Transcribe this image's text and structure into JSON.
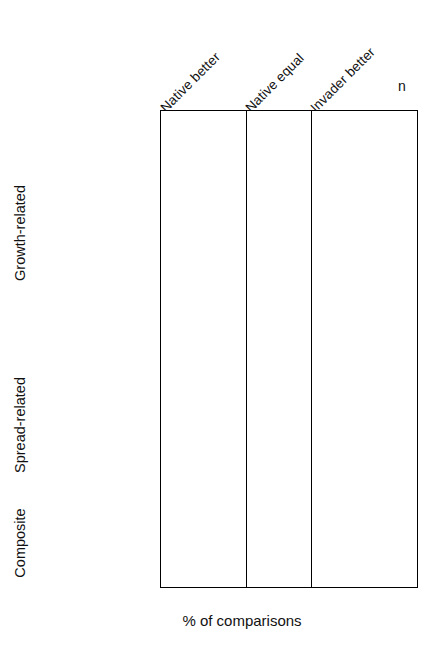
{
  "figure": {
    "axis_title": "% of comparisons",
    "n_header": "n",
    "column_headers": [
      {
        "id": "native-better",
        "label": "Native better"
      },
      {
        "id": "native-equal",
        "label": "Native equal"
      },
      {
        "id": "invader-better",
        "label": "Invader better"
      }
    ],
    "group_labels": [
      {
        "id": "growth-related",
        "label": "Growth-related"
      },
      {
        "id": "spread-related",
        "label": "Spread-related"
      },
      {
        "id": "composite",
        "label": "Composite"
      }
    ],
    "bar_color": "#9d9d9d",
    "bar_border_color": "#5a5a5a",
    "frame_color": "#000000",
    "significance_marker": "*"
  },
  "chart_data": {
    "type": "bar",
    "title": "",
    "xlabel": "% of comparisons",
    "ylabel": "",
    "xlim": [
      0,
      100
    ],
    "xticks": [
      0,
      25,
      50,
      75,
      100
    ],
    "grid": false,
    "legend": "none",
    "orientation": "horizontal",
    "panels": [
      "Native better",
      "Native equal",
      "Invader better"
    ],
    "panel_xticklabels": [
      [
        "0",
        "25",
        "50",
        "75"
      ],
      [
        "0",
        "25",
        "50",
        "75"
      ],
      [
        "0",
        "25",
        "50",
        "75",
        "100"
      ]
    ],
    "groups": [
      {
        "name": "Growth-related",
        "categories": [
          "growth rate",
          "photosynthesis",
          "construction",
          "leaf area",
          "roots",
          "herbivore damage",
          "grow season length",
          "water use",
          "salt tolerance"
        ],
        "n": [
          41,
          21,
          8,
          16,
          7,
          9,
          8,
          5,
          5
        ],
        "series": [
          {
            "name": "Native better",
            "values": [
              27,
              27,
              8,
              8,
              43,
              22,
              48,
              18,
              39
            ]
          },
          {
            "name": "Native equal",
            "values": [
              29,
              48,
              8,
              25,
              9,
              22,
              6,
              38,
              0
            ]
          },
          {
            "name": "Invader better",
            "values": [
              27,
              17,
              84,
              69,
              35,
              51,
              45,
              34,
              60
            ]
          }
        ],
        "significant": [
          {
            "category": "construction",
            "panel": "Invader better",
            "marker": "*"
          },
          {
            "category": "leaf area",
            "panel": "Invader better",
            "marker": "*"
          }
        ]
      },
      {
        "name": "Spread-related",
        "categories": [
          "fecundity",
          "germination",
          "dispersal",
          "survival"
        ],
        "n": [
          13,
          18,
          7,
          15
        ],
        "series": [
          {
            "name": "Native better",
            "values": [
              25,
              27,
              0,
              63
            ]
          },
          {
            "name": "Native equal",
            "values": [
              4,
              34,
              19,
              19
            ]
          },
          {
            "name": "Invader better",
            "values": [
              62,
              32,
              72,
              10
            ]
          }
        ],
        "significant": [
          {
            "category": "survival",
            "panel": "Native better",
            "marker": "*"
          }
        ]
      },
      {
        "name": "Composite",
        "categories": [
          "competition",
          "standing biomass",
          "plasticity"
        ],
        "n": [
          15,
          9,
          12
        ],
        "series": [
          {
            "name": "Native better",
            "values": [
              41,
              48,
              4
            ]
          },
          {
            "name": "Native equal",
            "values": [
              26,
              22,
              22
            ]
          },
          {
            "name": "Invader better",
            "values": [
              21,
              20,
              66
            ]
          }
        ],
        "significant": [
          {
            "category": "plasticity",
            "panel": "Invader better",
            "marker": "*"
          }
        ]
      }
    ]
  }
}
